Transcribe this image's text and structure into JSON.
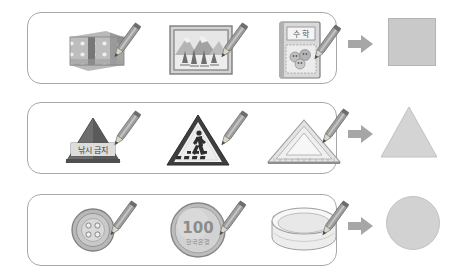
{
  "worksheet": {
    "title": "Shape classification worksheet",
    "background_color": "#ffffff",
    "box_border_color": "#a8a8a8",
    "arrow_color": "#a0a0a0",
    "result_fill_color": "#c9c9c9"
  },
  "rows": [
    {
      "id": "row-square",
      "result_shape": "square",
      "result_label": "square",
      "arrow_label": "arrow-right",
      "items": [
        {
          "name": "gift-box",
          "label": "polka dot gift box",
          "text": ""
        },
        {
          "name": "framed-picture",
          "label": "framed mountain picture",
          "text": ""
        },
        {
          "name": "math-textbook",
          "label": "math textbook",
          "text": "수 학"
        }
      ]
    },
    {
      "id": "row-triangle",
      "result_shape": "triangle",
      "result_label": "triangle",
      "arrow_label": "arrow-right",
      "items": [
        {
          "name": "pyramid-sign",
          "label": "triangular pyramid sign",
          "text": "낚시 금지"
        },
        {
          "name": "crosswalk-sign",
          "label": "pedestrian crossing sign",
          "text": ""
        },
        {
          "name": "set-square",
          "label": "triangular set square ruler",
          "text": ""
        }
      ]
    },
    {
      "id": "row-circle",
      "result_shape": "circle",
      "result_label": "circle",
      "arrow_label": "arrow-right",
      "items": [
        {
          "name": "sewing-button",
          "label": "four hole sewing button",
          "text": ""
        },
        {
          "name": "coin-100-won",
          "label": "100 won coin",
          "text": "100",
          "subtext": "한국은행"
        },
        {
          "name": "round-bowl",
          "label": "round shallow bowl",
          "text": ""
        }
      ]
    }
  ],
  "icons": {
    "pencil": "pencil-icon",
    "arrow": "arrow-right-icon"
  }
}
